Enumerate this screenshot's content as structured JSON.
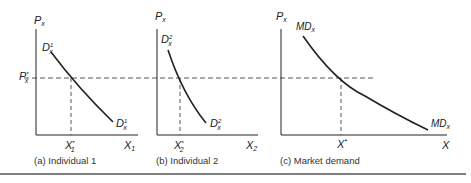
{
  "figure": {
    "panels": [
      {
        "id": "a",
        "caption": "(a) Individual 1",
        "y_axis_label": "P",
        "y_axis_sub": "x",
        "x_axis_label": "X",
        "x_axis_sub": "1",
        "curve_top_label": "D",
        "curve_top_sub": "x",
        "curve_top_sup": "1",
        "curve_bottom_label": "D",
        "curve_bottom_sub": "x",
        "curve_bottom_sup": "1",
        "price_label": "P",
        "price_sub": "x",
        "price_sup": "*",
        "quantity_label": "X",
        "quantity_sub": "1",
        "quantity_sup": "*"
      },
      {
        "id": "b",
        "caption": "(b) Individual 2",
        "y_axis_label": "P",
        "y_axis_sub": "x",
        "x_axis_label": "X",
        "x_axis_sub": "2",
        "curve_top_label": "D",
        "curve_top_sub": "x",
        "curve_top_sup": "2",
        "curve_bottom_label": "D",
        "curve_bottom_sub": "x",
        "curve_bottom_sup": "2",
        "quantity_label": "X",
        "quantity_sub": "2",
        "quantity_sup": "*"
      },
      {
        "id": "c",
        "caption": "(c) Market demand",
        "y_axis_label": "P",
        "y_axis_sub": "x",
        "x_axis_label": "X",
        "curve_top_label": "MD",
        "curve_top_sub": "x",
        "curve_bottom_label": "MD",
        "curve_bottom_sub": "x",
        "quantity_label": "X",
        "quantity_sup": "*"
      }
    ]
  },
  "colors": {
    "ink": "#222222",
    "dash": "#444444",
    "rule": "#555555"
  }
}
